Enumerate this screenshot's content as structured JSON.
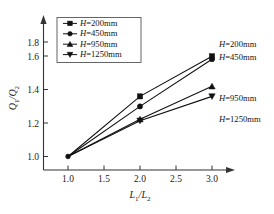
{
  "chart_data": {
    "type": "line",
    "title": "",
    "xlabel": "L1/L2",
    "ylabel": "Q1/Q2",
    "xlabel_parts": {
      "main1": "L",
      "sub1": "1",
      "slash": "/",
      "main2": "L",
      "sub2": "2"
    },
    "ylabel_parts": {
      "main1": "Q",
      "sub1": "1",
      "slash": "/",
      "main2": "Q",
      "sub2": "2"
    },
    "x": [
      1.0,
      2.0,
      3.0
    ],
    "xlim": [
      0.82,
      3.3
    ],
    "ylim": [
      0.86,
      1.92
    ],
    "xticks": [
      "1.0",
      "1.5",
      "2.0",
      "2.5",
      "3.0"
    ],
    "xtick_values": [
      1.0,
      1.5,
      2.0,
      2.5,
      3.0
    ],
    "yticks": [
      "1.0",
      "1.2",
      "1.4",
      "1.6",
      "1.8"
    ],
    "ytick_values": [
      1.0,
      1.2,
      1.4,
      1.6,
      1.8
    ],
    "grid": false,
    "legend_position": "upper-left-inside",
    "series": [
      {
        "name": "H=200mm",
        "marker": "square",
        "values": [
          1.0,
          1.42,
          1.7
        ]
      },
      {
        "name": "H=450mm",
        "marker": "circle",
        "values": [
          1.0,
          1.35,
          1.68
        ]
      },
      {
        "name": "H=950mm",
        "marker": "triangle-up",
        "values": [
          1.0,
          1.26,
          1.49
        ]
      },
      {
        "name": "H=1250mm",
        "marker": "triangle-down",
        "values": [
          1.0,
          1.25,
          1.42
        ]
      }
    ],
    "annotations": [
      {
        "text": "H=200mm",
        "series": 0
      },
      {
        "text": "H=450mm",
        "series": 1
      },
      {
        "text": "H=950mm",
        "series": 2
      },
      {
        "text": "H=1250mm",
        "series": 3
      }
    ]
  },
  "legend": {
    "items": [
      {
        "prefix": "H",
        "label": "=200mm",
        "marker": "square"
      },
      {
        "prefix": "H",
        "label": "=450mm",
        "marker": "circle"
      },
      {
        "prefix": "H",
        "label": "=950mm",
        "marker": "triangle-up"
      },
      {
        "prefix": "H",
        "label": "=1250mm",
        "marker": "triangle-down"
      }
    ]
  },
  "annotations_right": [
    {
      "prefix": "H",
      "label": "=200mm"
    },
    {
      "prefix": "H",
      "label": "=450mm"
    },
    {
      "prefix": "H",
      "label": "=950mm"
    },
    {
      "prefix": "H",
      "label": "=1250mm"
    }
  ],
  "axis": {
    "x_ticks": [
      "1.0",
      "1.5",
      "2.0",
      "2.5",
      "3.0"
    ],
    "y_ticks": [
      "1.0",
      "1.2",
      "1.4",
      "1.6",
      "1.8"
    ]
  },
  "colors": {
    "line": "#111111",
    "axis": "#333333",
    "text": "#111111",
    "background": "#ffffff"
  }
}
